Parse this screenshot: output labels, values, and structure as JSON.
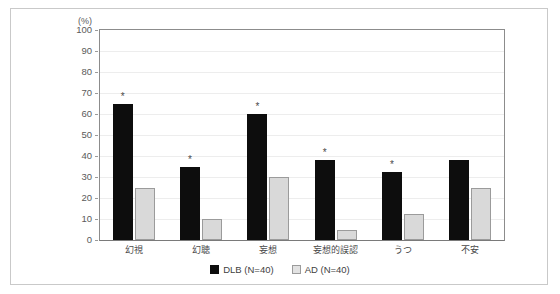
{
  "chart_data": {
    "type": "bar",
    "title": "",
    "subtitle": "",
    "xlabel": "",
    "ylabel": "",
    "unit_label": "(%)",
    "ylim": [
      0,
      100
    ],
    "ytick_step": 10,
    "yticks": [
      "100",
      "90",
      "80",
      "70",
      "60",
      "50",
      "40",
      "30",
      "20",
      "10",
      "0"
    ],
    "grid": true,
    "grid_axis": "y",
    "legend_position": "bottom-center",
    "categories": [
      "幻視",
      "幻聴",
      "妄想",
      "妄想的誤認",
      "うつ",
      "不安"
    ],
    "series": [
      {
        "name": "DLB (N=40)",
        "color": "#0d0d0d",
        "values": [
          65,
          35,
          60,
          38,
          32.5,
          38
        ],
        "significance": [
          "*",
          "*",
          "*",
          "*",
          "*",
          ""
        ]
      },
      {
        "name": "AD (N=40)",
        "color": "#d9d9d9",
        "values": [
          25,
          10,
          30,
          5,
          12.5,
          25
        ],
        "significance": [
          "",
          "",
          "",
          "",
          "",
          ""
        ]
      }
    ],
    "annotations": {
      "significance_marker": "*",
      "significance_note": "asterisk marks significant DLB vs AD difference"
    }
  },
  "legend": {
    "items": [
      {
        "label": "DLB (N=40)",
        "swatch": "black-square",
        "color": "#0d0d0d"
      },
      {
        "label": "AD (N=40)",
        "swatch": "light-gray-square",
        "color": "#d9d9d9"
      }
    ]
  },
  "colors": {
    "dlb": "#0d0d0d",
    "ad": "#d9d9d9",
    "ad_border": "#9b9b9b",
    "axis": "#8c8c8c",
    "grid": "#ededed",
    "frame": "#c9c9c9",
    "text": "#4a4a4a",
    "background": "#ffffff"
  }
}
